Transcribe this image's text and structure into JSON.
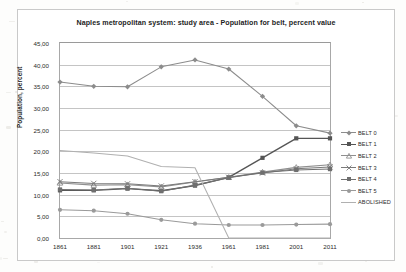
{
  "chart_data": {
    "type": "line",
    "title": "Naples metropolitan system: study area - Population for belt, percent value",
    "xlabel": "",
    "ylabel": "Population, percent",
    "x": [
      "1861",
      "1881",
      "1901",
      "1921",
      "1936",
      "1961",
      "1981",
      "2001",
      "2011"
    ],
    "ylim": [
      0,
      45
    ],
    "ytick_step": 5,
    "ytick_labels": [
      "45,00",
      "40,00",
      "35,00",
      "30,00",
      "25,00",
      "20,00",
      "15,00",
      "10,00",
      "5,00",
      "0,00"
    ],
    "grid": true,
    "legend_position": "right",
    "decimal_separator": ",",
    "series": [
      {
        "name": "BELT 0",
        "color": "#8c8c8c",
        "marker": "diamond",
        "values": [
          36.0,
          35.0,
          34.9,
          39.5,
          41.1,
          39.0,
          32.7,
          25.9,
          24.2
        ]
      },
      {
        "name": "BELT 1",
        "color": "#555555",
        "marker": "square",
        "values": [
          11.0,
          11.0,
          11.4,
          10.9,
          12.1,
          14.0,
          18.5,
          23.0,
          23.0
        ]
      },
      {
        "name": "BELT 2",
        "color": "#8f8f8f",
        "marker": "triangle",
        "values": [
          12.7,
          12.2,
          12.3,
          11.8,
          12.9,
          14.0,
          15.2,
          16.3,
          16.9
        ]
      },
      {
        "name": "BELT 3",
        "color": "#7a7a7a",
        "marker": "cross",
        "values": [
          13.0,
          12.6,
          12.5,
          12.0,
          13.0,
          14.0,
          15.0,
          16.0,
          16.4
        ]
      },
      {
        "name": "BELT 4",
        "color": "#6f6f6f",
        "marker": "square",
        "values": [
          11.2,
          11.1,
          11.5,
          10.8,
          12.2,
          13.9,
          15.1,
          15.7,
          15.9
        ]
      },
      {
        "name": "BELT 5",
        "color": "#9a9a9a",
        "marker": "circle",
        "values": [
          6.5,
          6.3,
          5.6,
          4.2,
          3.3,
          3.0,
          3.0,
          3.1,
          3.2
        ]
      },
      {
        "name": "ABOLISHED",
        "color": "#b0b0b0",
        "marker": "none",
        "values": [
          20.2,
          19.6,
          18.9,
          16.5,
          16.2,
          0.0,
          0.0,
          0.0,
          0.0
        ]
      }
    ]
  }
}
